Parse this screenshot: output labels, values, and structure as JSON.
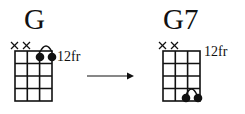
{
  "diagrams": [
    {
      "name": "G",
      "fret_label": "12fr",
      "muted_strings": [
        1,
        2
      ],
      "dots": [
        {
          "string": 3,
          "fret": 1
        },
        {
          "string": 4,
          "fret": 1
        }
      ],
      "barre": {
        "from_string": 3,
        "to_string": 4,
        "fret": 1
      }
    },
    {
      "name": "G7",
      "fret_label": "12fr",
      "muted_strings": [
        1,
        2
      ],
      "dots": [
        {
          "string": 3,
          "fret": 4
        },
        {
          "string": 4,
          "fret": 4
        }
      ],
      "barre": {
        "from_string": 3,
        "to_string": 4,
        "fret": 4
      }
    }
  ],
  "arrow": {
    "label": "",
    "direction": "right"
  },
  "colors": {
    "ink": "#111111",
    "background": "#ffffff"
  }
}
